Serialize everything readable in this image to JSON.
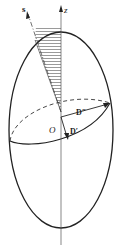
{
  "figure": {
    "type": "ellipsoid-diagram",
    "labels": {
      "s_axis": "s",
      "z_axis": "z",
      "origin": "O",
      "d_double_prime": "D″",
      "d_prime": "D′"
    },
    "colors": {
      "stroke": "#222222",
      "axis": "#555555",
      "background": "#ffffff"
    }
  }
}
